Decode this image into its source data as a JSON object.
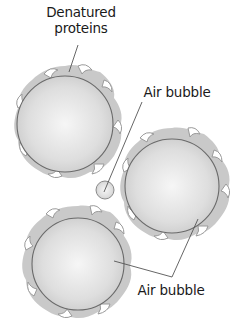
{
  "diagram": {
    "type": "foam-structure-illustration",
    "labels": {
      "denatured_proteins_line1": "Denatured",
      "denatured_proteins_line2": "proteins",
      "air_bubble_middle": "Air bubble",
      "air_bubble_bottom": "Air bubble"
    },
    "elements": [
      {
        "name": "air-bubble-top-left",
        "cx": 65,
        "cy": 124,
        "r": 48
      },
      {
        "name": "air-bubble-right",
        "cx": 172,
        "cy": 186,
        "r": 47
      },
      {
        "name": "air-bubble-bottom-left",
        "cx": 78,
        "cy": 264,
        "r": 46
      },
      {
        "name": "air-bubble-small",
        "cx": 105,
        "cy": 190,
        "r": 9
      }
    ],
    "colors": {
      "background": "#ffffff",
      "protein_layer": "#c9c9c9",
      "bubble_edge": "#6a6a6a",
      "bubble_center": "#f4f4f4",
      "bubble_outer": "#cfcfcf",
      "leader_line": "#555555",
      "text": "#1a1a1a"
    }
  }
}
